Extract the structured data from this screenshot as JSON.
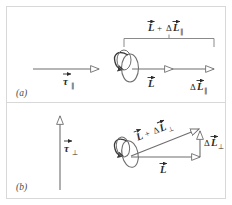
{
  "figure": {
    "type": "physics-vector-diagram",
    "background_color": "#ffffff",
    "border_color": "#d8d8d8",
    "line_color": "#6e6e6e",
    "text_color": "#2b2b2b",
    "width": 232,
    "height": 205
  },
  "panels": [
    {
      "id": "a",
      "label": "(a)",
      "description": "Torque parallel to angular momentum",
      "torque": {
        "symbol": "τ",
        "subscript": "∥",
        "vector": true,
        "orientation": "horizontal-right"
      },
      "disk": {
        "name": "spinning-disk",
        "spin_arrow": true,
        "orientation": "vertical-plane"
      },
      "bracket_label": {
        "lead": "L",
        "operator": "+",
        "delta": "Δ",
        "term": "L",
        "subscript": "∥",
        "text": "L + ΔL∥"
      },
      "vectors": [
        {
          "name": "L",
          "symbol": "L",
          "subscript": "",
          "text": "L",
          "orientation": "horizontal-right"
        },
        {
          "name": "delta-L-parallel",
          "symbol": "L",
          "delta": "Δ",
          "subscript": "∥",
          "text": "ΔL∥",
          "orientation": "horizontal-right"
        }
      ]
    },
    {
      "id": "b",
      "label": "(b)",
      "description": "Torque perpendicular to angular momentum",
      "torque": {
        "symbol": "τ",
        "subscript": "⊥",
        "vector": true,
        "orientation": "vertical-up"
      },
      "disk": {
        "name": "spinning-disk",
        "spin_arrow": true,
        "orientation": "tilted-plane"
      },
      "vectors": [
        {
          "name": "L",
          "symbol": "L",
          "subscript": "",
          "text": "L",
          "orientation": "horizontal-right"
        },
        {
          "name": "delta-L-perp",
          "symbol": "L",
          "delta": "Δ",
          "subscript": "⊥",
          "text": "ΔL⊥",
          "orientation": "vertical-up"
        },
        {
          "name": "L-plus-delta-L-perp",
          "symbol": "L",
          "operator": "+",
          "delta": "Δ",
          "subscript": "⊥",
          "text": "L + ΔL⊥",
          "orientation": "diagonal-up-right"
        }
      ]
    }
  ],
  "symbols": {
    "tau": "τ",
    "delta": "Δ",
    "parallel": "∥",
    "perpendicular": "⊥",
    "plus": "+",
    "L": "L"
  }
}
